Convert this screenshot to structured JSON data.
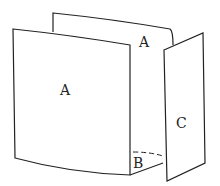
{
  "diagram": {
    "panels": [
      {
        "id": "back-panel",
        "label": "A"
      },
      {
        "id": "front-panel",
        "label": "A"
      },
      {
        "id": "side-panel",
        "label": "C"
      },
      {
        "id": "bottom-panel",
        "label": "B"
      }
    ]
  },
  "colors": {
    "stroke": "#222222",
    "fill": "#ffffff"
  }
}
